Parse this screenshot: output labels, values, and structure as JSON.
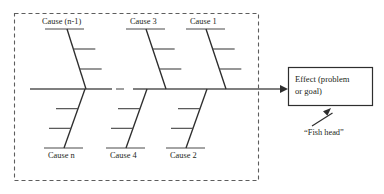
{
  "diagram": {
    "type": "fishbone",
    "colors": {
      "background": "#ffffff",
      "line": "#3a3a3a",
      "text": "#231f20",
      "boundary": "#5d5d5d",
      "box_border": "#2e2e2e"
    },
    "boundary": {
      "style": "dashed",
      "x": 14,
      "y": 13,
      "width": 244,
      "height": 167
    },
    "spine": {
      "y": 89,
      "start_x": 30,
      "end_x": 288,
      "gap_start_x": 112,
      "gap_end_x": 133,
      "arrowhead": "right"
    },
    "upper_causes": [
      {
        "label": "Cause (n-1)",
        "label_x": 42,
        "label_y": 24,
        "cap_x1": 45,
        "cap_x2": 84,
        "cap_y": 29,
        "bone_x1": 67,
        "bone_y1": 29,
        "bone_x2": 86,
        "bone_y2": 89,
        "ribs": 2
      },
      {
        "label": "Cause 3",
        "label_x": 130,
        "label_y": 24,
        "cap_x1": 126,
        "cap_x2": 165,
        "cap_y": 29,
        "bone_x1": 146,
        "bone_y1": 29,
        "bone_x2": 166,
        "bone_y2": 89,
        "ribs": 2
      },
      {
        "label": "Cause 1",
        "label_x": 190,
        "label_y": 24,
        "cap_x1": 186,
        "cap_x2": 225,
        "cap_y": 29,
        "bone_x1": 206,
        "bone_y1": 29,
        "bone_x2": 226,
        "bone_y2": 89,
        "ribs": 2
      }
    ],
    "lower_causes": [
      {
        "label": "Cause n",
        "label_x": 48,
        "label_y": 158,
        "cap_x1": 44,
        "cap_x2": 83,
        "cap_y": 148,
        "bone_x1": 64,
        "bone_y1": 148,
        "bone_x2": 85,
        "bone_y2": 89,
        "ribs": 2
      },
      {
        "label": "Cause 4",
        "label_x": 110,
        "label_y": 158,
        "cap_x1": 106,
        "cap_x2": 145,
        "cap_y": 148,
        "bone_x1": 126,
        "bone_y1": 148,
        "bone_x2": 147,
        "bone_y2": 89,
        "ribs": 2
      },
      {
        "label": "Cause 2",
        "label_x": 170,
        "label_y": 158,
        "cap_x1": 166,
        "cap_x2": 205,
        "cap_y": 148,
        "bone_x1": 186,
        "bone_y1": 148,
        "bone_x2": 207,
        "bone_y2": 89,
        "ribs": 2
      }
    ],
    "effect_box": {
      "line1": "Effect (problem",
      "line2": "or goal)",
      "x": 288,
      "y": 67,
      "width": 84,
      "height": 38
    },
    "annotation": {
      "label": "“Fish head”",
      "label_x": 304,
      "label_y": 135,
      "arrow_from_x": 312,
      "arrow_from_y": 126,
      "arrow_to_x": 331,
      "arrow_to_y": 108
    }
  }
}
